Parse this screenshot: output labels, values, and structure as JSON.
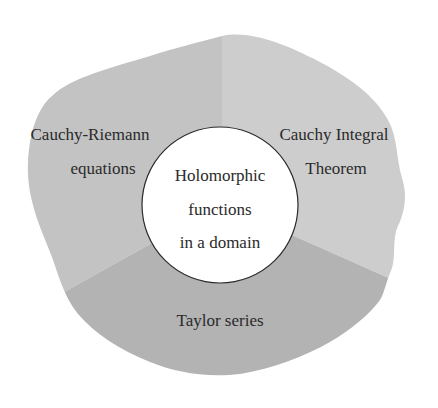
{
  "diagram": {
    "colors": {
      "background": "#ffffff",
      "region_cauchy_riemann": "#c3c3c3",
      "region_cauchy_integral": "#cdcdcd",
      "region_taylor": "#b3b3b3",
      "center_fill": "#ffffff",
      "center_stroke": "#2a2a2a",
      "text": "#2a2a2a"
    },
    "center": {
      "lines": [
        "Holomorphic",
        "functions",
        "in a domain"
      ]
    },
    "regions": [
      {
        "id": "cauchy-riemann",
        "lines": [
          "Cauchy-Riemann",
          "equations"
        ]
      },
      {
        "id": "cauchy-integral",
        "lines": [
          "Cauchy Integral",
          "Theorem"
        ]
      },
      {
        "id": "taylor",
        "lines": [
          "Taylor series"
        ]
      }
    ]
  }
}
